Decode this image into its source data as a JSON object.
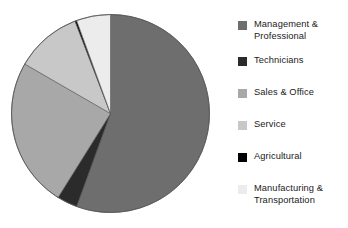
{
  "chart_data": {
    "type": "pie",
    "title": "",
    "subtitle": "",
    "xlabel": "",
    "ylabel": "",
    "grid": false,
    "legend_position": "right",
    "start_angle_deg": 0,
    "direction": "clockwise",
    "categories": [
      "Management & Professional",
      "Technicians",
      "Sales & Office",
      "Service",
      "Agricultural",
      "Manufacturing & Transportation"
    ],
    "values": [
      55.5,
      3.3,
      24.4,
      10.8,
      0.3,
      5.7
    ],
    "unit": "percent",
    "colors": [
      "#6e6e6e",
      "#2b2b2b",
      "#a8a8a8",
      "#c8c8c8",
      "#000000",
      "#ececec"
    ],
    "slices": [
      {
        "label": "Management & Professional",
        "value": 55.5,
        "color": "#6e6e6e",
        "start_deg": 0,
        "end_deg": 200
      },
      {
        "label": "Technicians",
        "value": 3.3,
        "color": "#2b2b2b",
        "start_deg": 200,
        "end_deg": 212
      },
      {
        "label": "Sales & Office",
        "value": 24.4,
        "color": "#a8a8a8",
        "start_deg": 212,
        "end_deg": 300
      },
      {
        "label": "Service",
        "value": 10.8,
        "color": "#c8c8c8",
        "start_deg": 300,
        "end_deg": 339
      },
      {
        "label": "Agricultural",
        "value": 0.3,
        "color": "#000000",
        "start_deg": 339,
        "end_deg": 340
      },
      {
        "label": "Manufacturing & Transportation",
        "value": 5.7,
        "color": "#ececec",
        "start_deg": 340,
        "end_deg": 360
      }
    ]
  },
  "legend": {
    "items": [
      {
        "label": "Management &\nProfessional",
        "color": "#6e6e6e",
        "top": 5
      },
      {
        "label": "Technicians",
        "color": "#2b2b2b",
        "top": 41
      },
      {
        "label": "Sales & Office",
        "color": "#a8a8a8",
        "top": 73
      },
      {
        "label": "Service",
        "color": "#c8c8c8",
        "top": 105
      },
      {
        "label": "Agricultural",
        "color": "#000000",
        "top": 137
      },
      {
        "label": "Manufacturing &\nTransportation",
        "color": "#ececec",
        "top": 169
      }
    ]
  },
  "figure": {
    "background": "#ffffff",
    "outline_color": "#555555"
  }
}
